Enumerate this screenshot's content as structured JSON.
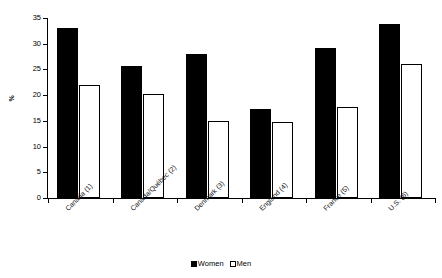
{
  "chart_data": {
    "type": "bar",
    "title": "",
    "xlabel": "",
    "ylabel": "%",
    "ylim": [
      0,
      35
    ],
    "yticks": [
      0,
      5,
      10,
      15,
      20,
      25,
      30,
      35
    ],
    "ytick_labels": [
      "0",
      "5",
      "10",
      "15",
      "20",
      "25",
      "30",
      "35"
    ],
    "grid": false,
    "legend_position": "bottom-center",
    "categories": [
      "Canada (1)",
      "Canada/Québec (2)",
      "Denmark (3)",
      "England (4)",
      "France (5)",
      "U.S. (6)"
    ],
    "series": [
      {
        "name": "Women",
        "color": "#000000",
        "style": "filled",
        "values": [
          33.0,
          25.6,
          28.0,
          17.3,
          29.1,
          33.9
        ]
      },
      {
        "name": "Men",
        "color": "#ffffff",
        "style": "hollow",
        "values": [
          22.0,
          20.3,
          15.0,
          14.7,
          17.7,
          26.0
        ]
      }
    ]
  },
  "axes": {
    "y_title": "%"
  },
  "legend": {
    "items": [
      {
        "label": "Women",
        "style": "filled"
      },
      {
        "label": "Men",
        "style": "hollow"
      }
    ]
  }
}
